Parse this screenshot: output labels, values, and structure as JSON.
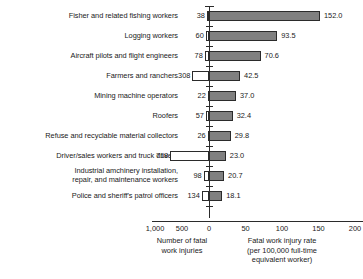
{
  "chart_data": {
    "type": "bar",
    "title": "",
    "subtitle": "",
    "orientation": "horizontal-diverging",
    "categories": [
      "Fisher and related fishing workers",
      "Logging workers",
      "Aircraft pilots and flight engineers",
      "Farmers and ranchers",
      "Mining machine operators",
      "Roofers",
      "Refuse and recyclable material collectors",
      "Driver/sales workers and truck drivers",
      "Industrial amchinery installation,\nrepair, and maintenance workers",
      "Police and sheriff's patrol officers"
    ],
    "series": [
      {
        "name": "Number of fatal work injuries",
        "direction": "left",
        "color": "#ffffff",
        "values": [
          38,
          60,
          78,
          308,
          22,
          57,
          26,
          718,
          98,
          134
        ],
        "value_labels": [
          "38",
          "60",
          "78",
          "308",
          "22",
          "57",
          "26",
          "718",
          "98",
          "134"
        ],
        "axis_range": [
          1000,
          0
        ],
        "ticks": [
          1000,
          500,
          0
        ],
        "tick_labels": [
          "1,000",
          "500",
          "0"
        ],
        "axis_title": "Number of fatal\nwork injuries"
      },
      {
        "name": "Fatal work injury rate (per 100,000 full-time equivalent worker)",
        "direction": "right",
        "color": "#808080",
        "values": [
          152.0,
          93.5,
          70.6,
          42.5,
          37.0,
          32.4,
          29.8,
          23.0,
          20.7,
          18.1
        ],
        "value_labels": [
          "152.0",
          "93.5",
          "70.6",
          "42.5",
          "37.0",
          "32.4",
          "29.8",
          "23.0",
          "20.7",
          "18.1"
        ],
        "axis_range": [
          0,
          200
        ],
        "ticks": [
          0,
          50,
          100,
          150,
          200
        ],
        "tick_labels": [
          "0",
          "50",
          "100",
          "150",
          "200"
        ],
        "axis_title": "Fatal work injury rate\n(per 100,000 full-time\nequivalent worker)"
      }
    ],
    "xlabel": "",
    "ylabel": "",
    "grid": false,
    "legend": "none"
  },
  "axis": {
    "left_tick_labels": [
      "1,000",
      "500",
      "0"
    ],
    "right_tick_labels": [
      "50",
      "100",
      "150",
      "200"
    ],
    "left_caption": "Number of fatal\nwork injuries",
    "right_caption": "Fatal work injury rate\n(per 100,000 full-time\nequivalent worker)"
  }
}
